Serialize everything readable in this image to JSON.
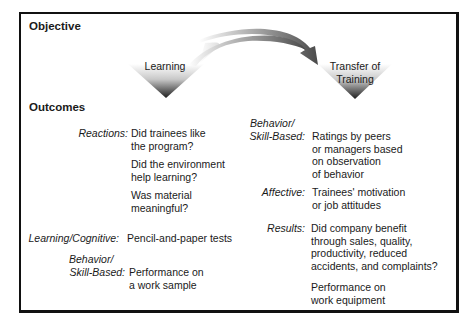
{
  "objective_heading": "Objective",
  "outcomes_heading": "Outcomes",
  "stages": {
    "learning": "Learning",
    "transfer_line1": "Transfer of",
    "transfer_line2": "Training"
  },
  "left_column": {
    "reactions": {
      "label": "Reactions:",
      "items": [
        [
          "Did trainees like",
          "the program?"
        ],
        [
          "Did the environment",
          "help learning?"
        ],
        [
          "Was material",
          "meaningful?"
        ]
      ]
    },
    "learning_cognitive": {
      "label": "Learning/Cognitive:",
      "text": "Pencil-and-paper tests"
    },
    "behavior": {
      "label_line1": "Behavior/",
      "label_line2": "Skill-Based:",
      "lines": [
        "Performance on",
        "a work sample"
      ]
    }
  },
  "right_column": {
    "behavior": {
      "label_line1": "Behavior/",
      "label_line2": "Skill-Based:",
      "lines": [
        "Ratings by peers",
        "or managers based",
        "on observation",
        "of behavior"
      ]
    },
    "affective": {
      "label": "Affective:",
      "lines": [
        "Trainees' motivation",
        "or job attitudes"
      ]
    },
    "results": {
      "label": "Results:",
      "lines": [
        "Did company benefit",
        "through sales, quality,",
        "productivity, reduced",
        "accidents, and complaints?"
      ],
      "extra_lines": [
        "Performance on",
        "work equipment"
      ]
    }
  }
}
